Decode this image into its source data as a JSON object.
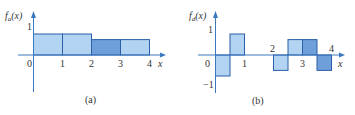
{
  "chart_data": [
    {
      "type": "bar",
      "panel": "(a)",
      "ylabel": "f_a(x)",
      "xlabel": "x",
      "x_ticks": [
        "0",
        "1",
        "2",
        "3",
        "4"
      ],
      "y_ticks": [
        "1"
      ],
      "bars": [
        {
          "x0": 0,
          "x1": 1,
          "value": 0.75,
          "shade": "light"
        },
        {
          "x0": 1,
          "x1": 2,
          "value": 0.75,
          "shade": "light"
        },
        {
          "x0": 2,
          "x1": 3,
          "value": 0.55,
          "shade": "dark"
        },
        {
          "x0": 3,
          "x1": 4,
          "value": 0.55,
          "shade": "light"
        }
      ],
      "xlim": [
        0,
        4
      ],
      "ylim": [
        -1,
        1
      ],
      "grid": false
    },
    {
      "type": "bar",
      "panel": "(b)",
      "ylabel": "f_d(x)",
      "xlabel": "x",
      "x_ticks": [
        "0",
        "1",
        "2",
        "3",
        "4"
      ],
      "y_ticks": [
        "1",
        "-1"
      ],
      "bars": [
        {
          "x0": 0,
          "x1": 0.5,
          "value": -0.75,
          "shade": "light"
        },
        {
          "x0": 0.5,
          "x1": 1,
          "value": 0.75,
          "shade": "light"
        },
        {
          "x0": 2,
          "x1": 2.5,
          "value": -0.55,
          "shade": "light"
        },
        {
          "x0": 2.5,
          "x1": 3,
          "value": 0.55,
          "shade": "light"
        },
        {
          "x0": 3,
          "x1": 3.5,
          "value": 0.55,
          "shade": "dark"
        },
        {
          "x0": 3.5,
          "x1": 4,
          "value": -0.55,
          "shade": "dark"
        }
      ],
      "xlim": [
        0,
        4
      ],
      "ylim": [
        -1,
        1
      ],
      "grid": false
    }
  ],
  "colors": {
    "light": "#b3d3f2",
    "dark": "#6f9fd8",
    "outline": "#2b5fa8",
    "axis": "#3a78c0"
  },
  "labels": {
    "a": {
      "fn": "f",
      "sub": "a",
      "arg": "(x)",
      "caption": "(a)",
      "x": "x",
      "t0": "0",
      "t1": "1",
      "t2": "2",
      "t3": "3",
      "t4": "4",
      "y1": "1"
    },
    "b": {
      "fn": "f",
      "sub": "d",
      "arg": "(x)",
      "caption": "(b)",
      "x": "x",
      "t0": "0",
      "t1": "1",
      "t2": "2",
      "t3": "3",
      "t4": "4",
      "y1": "1",
      "ym1": "−1"
    }
  }
}
